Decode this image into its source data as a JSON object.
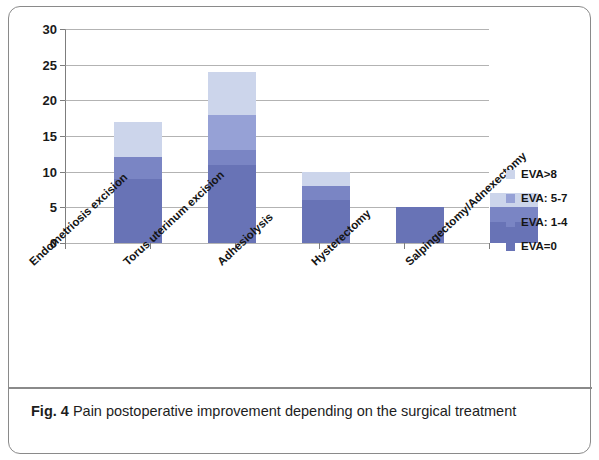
{
  "figure": {
    "caption_number": "Fig. 4",
    "caption_text": "Pain postoperative improvement depending on the surgical treatment"
  },
  "chart_data": {
    "type": "bar",
    "subtype": "stacked",
    "title": "",
    "xlabel": "",
    "ylabel": "",
    "ylim": [
      0,
      30
    ],
    "ytick_step": 5,
    "ytick_labels": [
      "0",
      "5",
      "10",
      "15",
      "20",
      "25",
      "30"
    ],
    "grid": true,
    "legend_position": "right",
    "categories": [
      "Endometriosis excision",
      "Torus uterinum excision",
      "Adhesiolysis",
      "Hysterectomy",
      "Salpingectomy/Adnexectomy"
    ],
    "series": [
      {
        "name": "EVA=0",
        "color": "#6873b6",
        "values": [
          9,
          11,
          6,
          5,
          3
        ]
      },
      {
        "name": "EVA: 1-4",
        "color": "#7a85c4",
        "values": [
          3,
          2,
          2,
          0,
          2
        ]
      },
      {
        "name": "EVA: 5-7",
        "color": "#96a1d6",
        "values": [
          0,
          5,
          0,
          0,
          0
        ]
      },
      {
        "name": "EVA>8",
        "color": "#ccd5eb",
        "values": [
          5,
          6,
          2,
          0,
          2
        ]
      }
    ],
    "totals": [
      17,
      24,
      10,
      5,
      7
    ],
    "legend_entries": [
      {
        "label": "EVA>8",
        "color": "#ccd5eb"
      },
      {
        "label": "EVA: 5-7",
        "color": "#96a1d6"
      },
      {
        "label": "EVA: 1-4",
        "color": "#7a85c4"
      },
      {
        "label": "EVA=0",
        "color": "#6873b6"
      }
    ]
  }
}
